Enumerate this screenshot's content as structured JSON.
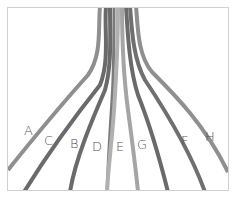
{
  "diagram": {
    "type": "strand-bundle",
    "frame": {
      "border_color": "#d0d0d0"
    },
    "strands": [
      {
        "label": "A",
        "color": "#8f8f8f",
        "label_pos": [
          24,
          124
        ]
      },
      {
        "label": "C",
        "color": "#6a6a6a",
        "label_pos": [
          44,
          134
        ]
      },
      {
        "label": "B",
        "color": "#6a6a6a",
        "label_pos": [
          70,
          137
        ]
      },
      {
        "label": "D",
        "color": "#7a7a7a",
        "label_pos": [
          92,
          140
        ]
      },
      {
        "label": "E",
        "color": "#a9a9a9",
        "label_pos": [
          116,
          140
        ]
      },
      {
        "label": "G",
        "color": "#9c9c9c",
        "label_pos": [
          137,
          138
        ]
      },
      {
        "label": "F",
        "color": "#6f6f6f",
        "label_pos": [
          181,
          134
        ]
      },
      {
        "label": "H",
        "color": "#8f8f8f",
        "label_pos": [
          205,
          130
        ]
      }
    ]
  }
}
